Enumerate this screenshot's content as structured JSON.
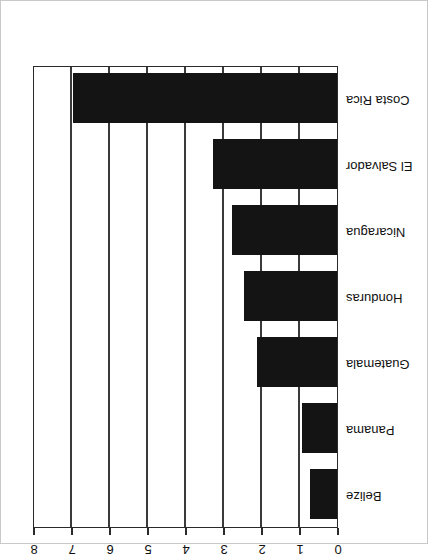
{
  "chart_data": {
    "type": "bar",
    "orientation": "horizontal",
    "title": "",
    "xlabel": "",
    "ylabel": "",
    "xlim": [
      0,
      8
    ],
    "xticks": [
      0,
      1,
      2,
      3,
      4,
      5,
      6,
      7,
      8
    ],
    "xtick_labels": [
      "0",
      "1",
      "2",
      "3",
      "4",
      "5",
      "6",
      "7",
      "8"
    ],
    "grid": true,
    "grid_axis": "x",
    "legend": "none",
    "rotation_deg": 180,
    "bar_color": "#141414",
    "axis_color": "#2a2a2a",
    "background": "#ffffff",
    "categories": [
      "Belize",
      "Panama",
      "Guatemala",
      "Honduras",
      "Nicaragua",
      "El Salvador",
      "Costa Rica"
    ],
    "values": [
      0.72,
      0.92,
      2.1,
      2.45,
      2.75,
      3.25,
      6.95
    ],
    "bars": [
      {
        "category": "Belize",
        "value": 0.72
      },
      {
        "category": "Panama",
        "value": 0.92
      },
      {
        "category": "Guatemala",
        "value": 2.1
      },
      {
        "category": "Honduras",
        "value": 2.45
      },
      {
        "category": "Nicaragua",
        "value": 2.75
      },
      {
        "category": "El Salvador",
        "value": 3.25
      },
      {
        "category": "Costa Rica",
        "value": 6.95
      }
    ]
  }
}
